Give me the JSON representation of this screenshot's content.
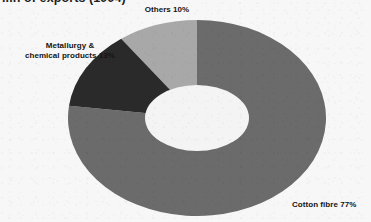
{
  "title": "...n of exports (1994)",
  "colors": {
    "background": "#f7f7f7",
    "cotton_fibre": "#6b6b6b",
    "metallurgy": "#2a2a2a",
    "others": "#a8a8a8",
    "hole": "#f4f4f4",
    "label_text": "#141414"
  },
  "labels": {
    "others": "Others 10%",
    "metallurgy_line1": "Metallurgy &",
    "metallurgy_line2": "chemical products 13%",
    "cotton": "Cotton fibre 77%"
  },
  "chart_data": {
    "type": "pie",
    "variant": "donut",
    "title": "...n of exports (1994)",
    "unit": "percent",
    "total": 100,
    "start_angle_deg": 0,
    "direction": "clockwise",
    "legend": "none",
    "labels_position": "outside-callout",
    "categories": [
      "Cotton fibre",
      "Others",
      "Metallurgy & chemical products"
    ],
    "values": [
      77,
      10,
      13
    ],
    "slices": [
      {
        "name": "Cotton fibre",
        "value": 77,
        "label": "Cotton fibre 77%",
        "color": "#6b6b6b",
        "start_deg": 0,
        "end_deg": 277.2
      },
      {
        "name": "Others",
        "value": 10,
        "label": "Others 10%",
        "color": "#a8a8a8",
        "start_deg": 324.0,
        "end_deg": 360.0
      },
      {
        "name": "Metallurgy & chemical products",
        "value": 13,
        "label": "Metallurgy & chemical products 13%",
        "color": "#2a2a2a",
        "start_deg": 277.2,
        "end_deg": 324.0
      }
    ]
  }
}
